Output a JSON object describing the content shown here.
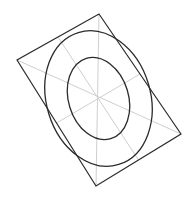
{
  "diagram": {
    "colors": {
      "background": "#ffffff",
      "outline": "#2b2b2b",
      "ellipse": "#2b2b2b",
      "guide": "#cfcfcf"
    },
    "quad": {
      "points": "99,14 181,134 96,186 17,60"
    },
    "guides": [
      {
        "name": "diagonal-vertical",
        "x1": 99,
        "y1": 14,
        "x2": 96,
        "y2": 186
      },
      {
        "name": "diagonal-horizontal",
        "x1": 17,
        "y1": 60,
        "x2": 181,
        "y2": 134
      },
      {
        "name": "midline-a",
        "x1": 58,
        "y1": 37,
        "x2": 138.5,
        "y2": 160
      },
      {
        "name": "midline-b",
        "x1": 56.5,
        "y1": 123,
        "x2": 140,
        "y2": 74
      }
    ],
    "ellipses": [
      {
        "name": "outer-ellipse",
        "cx": 98.5,
        "cy": 98.5,
        "rx": 52,
        "ry": 69,
        "rotate": -17
      },
      {
        "name": "inner-ellipse",
        "cx": 98.5,
        "cy": 98.5,
        "rx": 30,
        "ry": 42,
        "rotate": -17
      }
    ]
  }
}
